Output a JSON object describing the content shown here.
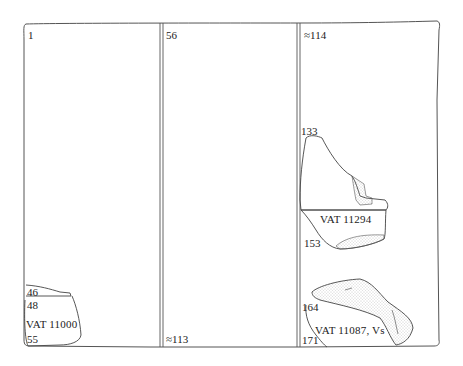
{
  "diagram": {
    "type": "tablet-reconstruction",
    "columns": [
      {
        "index": 1,
        "top_label": "1",
        "bottom_label": "55",
        "fragments": [
          {
            "id": "VAT 11000",
            "line_labels": [
              "46",
              "48",
              "55"
            ]
          }
        ]
      },
      {
        "index": 2,
        "top_label": "56",
        "bottom_label": "≈113",
        "fragments": []
      },
      {
        "index": 3,
        "top_label": "≈114",
        "bottom_label": "171",
        "fragments": [
          {
            "id": "VAT 11294",
            "line_labels": [
              "133",
              "153"
            ]
          },
          {
            "id": "VAT 11087, Vs",
            "line_labels": [
              "164",
              "171"
            ]
          }
        ]
      }
    ]
  },
  "labels": {
    "col1_top": "1",
    "col2_top": "56",
    "col3_top": "≈114",
    "col2_bottom": "≈113",
    "frag1_l46": "46",
    "frag1_l48": "48",
    "frag1_name": "VAT 11000",
    "frag1_l55": "55",
    "frag2_l133": "133",
    "frag2_name": "VAT 11294",
    "frag2_l153": "153",
    "frag3_l164": "164",
    "frag3_name": "VAT 11087, Vs",
    "frag3_l171": "171"
  },
  "colors": {
    "line": "#555555",
    "stipple": "#9a9a9a"
  }
}
